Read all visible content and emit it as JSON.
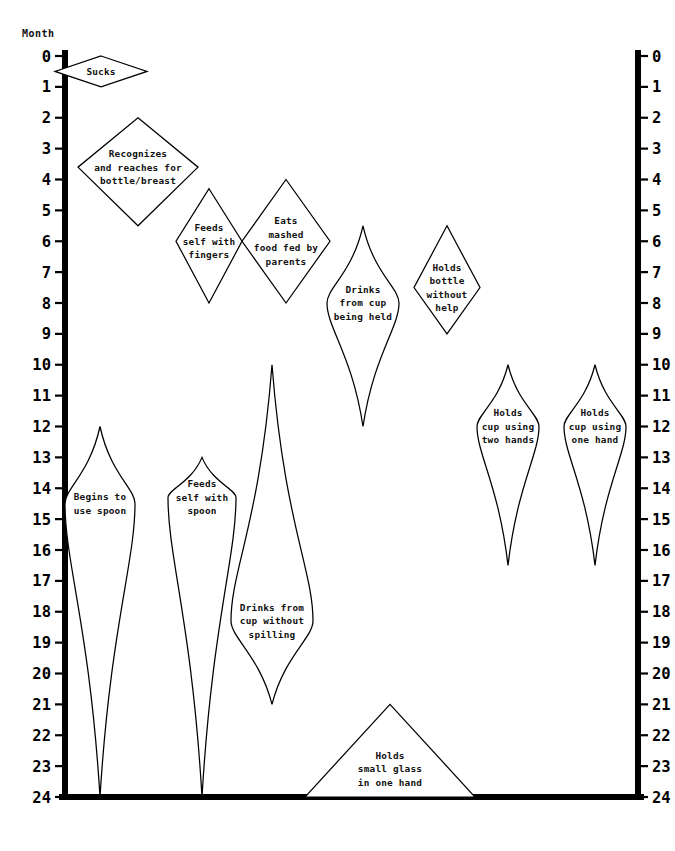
{
  "chart_data": {
    "type": "area",
    "title": "",
    "subtitle": "",
    "ylabel": "Month",
    "xlabel": "",
    "ylim": [
      0,
      24
    ],
    "grid": false,
    "legend": "none",
    "y_axis": {
      "label": "Month",
      "position": "both",
      "ticks": [
        0,
        1,
        2,
        3,
        4,
        5,
        6,
        7,
        8,
        9,
        10,
        11,
        12,
        13,
        14,
        15,
        16,
        17,
        18,
        19,
        20,
        21,
        22,
        23,
        24
      ],
      "tick_labels": [
        "0",
        "1",
        "2",
        "3",
        "4",
        "5",
        "6",
        "7",
        "8",
        "9",
        "10",
        "11",
        "12",
        "13",
        "14",
        "15",
        "16",
        "17",
        "18",
        "19",
        "20",
        "21",
        "22",
        "23",
        "24"
      ],
      "direction": "top-to-bottom",
      "unit": "months"
    },
    "categories": [
      "Sucks",
      "Recognizes and reaches for bottle/breast",
      "Feeds self with fingers",
      "Eats mashed food fed by parents",
      "Drinks from cup being held",
      "Holds bottle without help",
      "Begins to use spoon",
      "Feeds self with spoon",
      "Drinks from cup without spilling",
      "Holds cup using two hands",
      "Holds cup using one hand",
      "Holds small glass in one hand"
    ],
    "series": [
      {
        "name": "start_month",
        "values": [
          0,
          2,
          4.3,
          4,
          5.5,
          5.5,
          12,
          13,
          10,
          10,
          10,
          21
        ]
      },
      {
        "name": "peak_month",
        "values": [
          0.5,
          3.6,
          6,
          6,
          8,
          7.5,
          14.5,
          14.3,
          18.3,
          12,
          12,
          24
        ]
      },
      {
        "name": "end_month",
        "values": [
          1,
          5.5,
          8,
          8,
          12,
          9,
          24,
          24,
          21,
          16.5,
          16.5,
          24
        ]
      }
    ],
    "milestones": [
      {
        "id": "sucks",
        "label": "Sucks",
        "lines": [
          "Sucks"
        ],
        "start_month": 0,
        "peak_month": 0.5,
        "end_month": 1,
        "shape": "diamond"
      },
      {
        "id": "recognizes-reaches-bottle-breast",
        "label": "Recognizes and reaches for bottle/breast",
        "lines": [
          "Recognizes",
          "and reaches for",
          "bottle/breast"
        ],
        "start_month": 2,
        "peak_month": 3.6,
        "end_month": 5.5,
        "shape": "diamond"
      },
      {
        "id": "feeds-self-with-fingers",
        "label": "Feeds self with fingers",
        "lines": [
          "Feeds",
          "self with",
          "fingers"
        ],
        "start_month": 4.3,
        "peak_month": 6,
        "end_month": 8,
        "shape": "kite"
      },
      {
        "id": "eats-mashed-food-fed-by-parents",
        "label": "Eats mashed food fed by parents",
        "lines": [
          "Eats",
          "mashed",
          "food fed by",
          "parents"
        ],
        "start_month": 4,
        "peak_month": 6,
        "end_month": 8,
        "shape": "diamond"
      },
      {
        "id": "drinks-from-cup-being-held",
        "label": "Drinks from cup being held",
        "lines": [
          "Drinks",
          "from cup",
          "being held"
        ],
        "start_month": 5.5,
        "peak_month": 8,
        "end_month": 12,
        "shape": "tapered"
      },
      {
        "id": "holds-bottle-without-help",
        "label": "Holds bottle without help",
        "lines": [
          "Holds",
          "bottle",
          "without",
          "help"
        ],
        "start_month": 5.5,
        "peak_month": 7.5,
        "end_month": 9,
        "shape": "kite"
      },
      {
        "id": "begins-to-use-spoon",
        "label": "Begins to use spoon",
        "lines": [
          "Begins to",
          "use spoon"
        ],
        "start_month": 12,
        "peak_month": 14.5,
        "end_month": 24,
        "shape": "tapered"
      },
      {
        "id": "feeds-self-with-spoon",
        "label": "Feeds self with spoon",
        "lines": [
          "Feeds",
          "self with",
          "spoon"
        ],
        "start_month": 13,
        "peak_month": 14.3,
        "end_month": 24,
        "shape": "tapered"
      },
      {
        "id": "drinks-from-cup-without-spilling",
        "label": "Drinks from cup without spilling",
        "lines": [
          "Drinks from",
          "cup without",
          "spilling"
        ],
        "start_month": 10,
        "peak_month": 18.3,
        "end_month": 21,
        "shape": "tapered"
      },
      {
        "id": "holds-cup-using-two-hands",
        "label": "Holds cup using two hands",
        "lines": [
          "Holds",
          "cup using",
          "two hands"
        ],
        "start_month": 10,
        "peak_month": 12,
        "end_month": 16.5,
        "shape": "tapered"
      },
      {
        "id": "holds-cup-using-one-hand",
        "label": "Holds cup using one hand",
        "lines": [
          "Holds",
          "cup using",
          "one hand"
        ],
        "start_month": 10,
        "peak_month": 12,
        "end_month": 16.5,
        "shape": "tapered"
      },
      {
        "id": "holds-small-glass-in-one-hand",
        "label": "Holds small glass in one hand",
        "lines": [
          "Holds",
          "small glass",
          "in one hand"
        ],
        "start_month": 21,
        "peak_month": 24,
        "end_month": 24,
        "shape": "triangle"
      }
    ]
  },
  "colors": {
    "ink": "#000000",
    "background": "#ffffff",
    "shape_fill": "#ffffff",
    "shape_stroke": "#000000"
  }
}
